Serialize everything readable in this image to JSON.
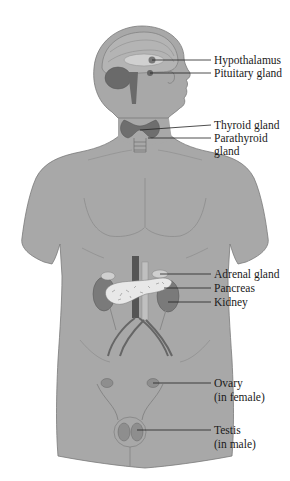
{
  "diagram": {
    "colors": {
      "body_fill": "#a8a8a8",
      "body_stroke": "#7a7a7a",
      "organ_dark": "#5e5e5e",
      "organ_mid": "#8a8a8a",
      "organ_light": "#c9c9c9",
      "pancreas_fill": "#e8e8e8",
      "leader_line": "#222222",
      "text": "#1a1a1a"
    },
    "labels": [
      {
        "id": "hypothalamus",
        "text": "Hypothalamus",
        "y": 54
      },
      {
        "id": "pituitary",
        "text": "Pituitary gland",
        "y": 67
      },
      {
        "id": "thyroid",
        "text": "Thyroid gland",
        "y": 119
      },
      {
        "id": "parathyroid",
        "text": "Parathyroid",
        "y": 132
      },
      {
        "id": "parathyroid-2",
        "text": "gland",
        "y": 145
      },
      {
        "id": "adrenal",
        "text": "Adrenal gland",
        "y": 268
      },
      {
        "id": "pancreas",
        "text": "Pancreas",
        "y": 282
      },
      {
        "id": "kidney",
        "text": "Kidney",
        "y": 296
      },
      {
        "id": "ovary",
        "text": "Ovary",
        "y": 377
      },
      {
        "id": "ovary-2",
        "text": "(in female)",
        "y": 391
      },
      {
        "id": "testis",
        "text": "Testis",
        "y": 424
      },
      {
        "id": "testis-2",
        "text": "(in male)",
        "y": 438
      }
    ]
  }
}
